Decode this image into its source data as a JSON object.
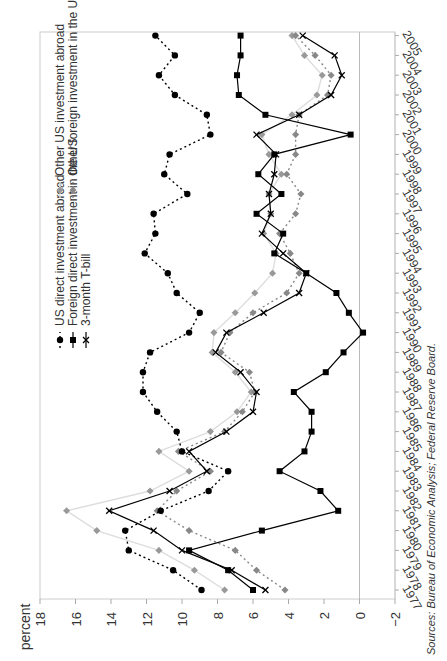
{
  "chart_data": {
    "type": "line",
    "orientation": "rotated-90-clockwise",
    "title": "",
    "ylabel": "percent",
    "xlabel": "",
    "ylim": [
      -2,
      18
    ],
    "yticks": [
      18,
      16,
      14,
      12,
      10,
      8,
      6,
      4,
      2,
      0,
      -2
    ],
    "x": [
      1977,
      1978,
      1979,
      1980,
      1981,
      1982,
      1983,
      1984,
      1985,
      1986,
      1987,
      1988,
      1989,
      1990,
      1991,
      1992,
      1993,
      1994,
      1995,
      1996,
      1997,
      1998,
      1999,
      2000,
      2001,
      2002,
      2003,
      2004,
      2005
    ],
    "grid": false,
    "legend_position": "upper-left (rotated)",
    "series": [
      {
        "name": "US direct investment abroad",
        "style": "dotted",
        "marker": "circle",
        "color": "#000000",
        "values": [
          8.9,
          10.5,
          13.0,
          13.2,
          11.2,
          8.5,
          7.4,
          10.0,
          10.3,
          11.4,
          12.2,
          12.2,
          11.8,
          9.6,
          9.0,
          10.3,
          10.8,
          12.1,
          11.5,
          11.6,
          9.7,
          11.0,
          10.7,
          8.4,
          8.6,
          10.4,
          11.3,
          10.4,
          11.5
        ]
      },
      {
        "name": "Foreign direct investment in the US",
        "style": "solid",
        "marker": "square",
        "color": "#000000",
        "values": [
          6.0,
          7.4,
          9.6,
          5.5,
          1.2,
          2.2,
          4.5,
          3.1,
          2.7,
          2.7,
          3.7,
          1.9,
          0.9,
          -0.2,
          0.6,
          1.3,
          3.0,
          4.8,
          4.3,
          5.8,
          4.4,
          5.7,
          4.8,
          0.5,
          5.3,
          6.8,
          6.9,
          6.7,
          6.7
        ]
      },
      {
        "name": "3-month T-bill",
        "style": "solid",
        "marker": "x",
        "color": "#000000",
        "values": [
          5.3,
          7.2,
          10.0,
          11.6,
          14.1,
          10.7,
          8.6,
          9.6,
          7.5,
          6.0,
          5.8,
          6.7,
          8.1,
          7.5,
          5.4,
          3.4,
          3.0,
          4.3,
          5.5,
          5.0,
          5.1,
          4.8,
          4.7,
          5.8,
          3.4,
          1.6,
          1.0,
          1.4,
          3.2
        ]
      },
      {
        "name": "Other US investment abroad",
        "style": "solid-light",
        "marker": "diamond",
        "color": "#999999",
        "values": [
          7.6,
          9.3,
          11.3,
          14.8,
          16.5,
          11.8,
          9.6,
          11.3,
          8.4,
          6.9,
          6.1,
          7.0,
          8.3,
          8.2,
          7.0,
          5.9,
          4.9,
          4.7,
          5.4,
          5.0,
          5.1,
          4.4,
          5.1,
          5.5,
          3.8,
          2.4,
          2.1,
          3.1,
          3.8
        ]
      },
      {
        "name": "Other foreign investment in the US",
        "style": "dotted",
        "marker": "diamond",
        "color": "#888888",
        "values": [
          4.2,
          5.8,
          7.0,
          9.6,
          11.4,
          10.3,
          8.4,
          10.2,
          7.6,
          6.6,
          5.9,
          6.2,
          7.8,
          7.3,
          6.0,
          4.1,
          3.4,
          3.9,
          4.5,
          3.6,
          3.3,
          4.1,
          3.6,
          3.6,
          3.4,
          1.8,
          1.6,
          2.5,
          3.6
        ]
      }
    ]
  },
  "labels": {
    "axis_title": "percent",
    "source": "Sources: Bureau of Economic Analysis; Federal Reserve Board.",
    "legend": [
      "US direct investment abroad",
      "Foreign direct investment in the US",
      "3-month T-bill",
      "Other US investment abroad",
      "Other foreign investment in the US"
    ]
  }
}
